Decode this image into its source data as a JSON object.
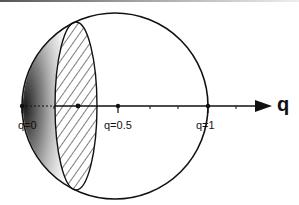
{
  "diagram": {
    "axis_label": "q",
    "tick_labels": [
      {
        "text": "q=0",
        "value": 0
      },
      {
        "text": "q=0.5",
        "value": 0.5
      },
      {
        "text": "q=1",
        "value": 1
      }
    ],
    "elements": {
      "outer_circle": "sphere outline",
      "stippled_region": "shaded cap near q=0",
      "hatched_ellipse": "hatched cross-section disk",
      "arrow": "q axis arrow"
    },
    "colors": {
      "line": "#111111",
      "background": "#ffffff"
    }
  }
}
